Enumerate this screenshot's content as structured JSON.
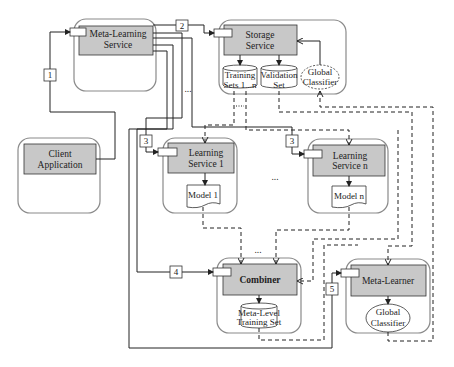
{
  "diagram": {
    "title": "",
    "nodes": {
      "meta_learning_service": {
        "label_1": "Meta-Learning",
        "label_2": "Service"
      },
      "storage_service": {
        "label_1": "Storage",
        "label_2": "Service"
      },
      "training_sets": {
        "label_1": "Training",
        "label_2": "Sets 1...n"
      },
      "validation_set": {
        "label_1": "Validation",
        "label_2": "Set"
      },
      "global_classifier_storage": {
        "label_1": "Global",
        "label_2": "Classifier"
      },
      "client_application": {
        "label_1": "Client",
        "label_2": "Application"
      },
      "learning_service_1": {
        "label_1": "Learning",
        "label_2": "Service 1"
      },
      "model_1": {
        "label": "Model 1"
      },
      "learning_service_n": {
        "label_1": "Learning",
        "label_2": "Service n"
      },
      "model_n": {
        "label": "Model n"
      },
      "combiner": {
        "label": "Combiner"
      },
      "meta_level_training_set": {
        "label_1": "Meta-Level",
        "label_2": "Training Set"
      },
      "meta_learner": {
        "label": "Meta-Learner"
      },
      "global_classifier_meta": {
        "label_1": "Global",
        "label_2": "Classifier"
      }
    },
    "steps": [
      "1",
      "2",
      "3",
      "3",
      "4",
      "5"
    ],
    "ellipsis": "...",
    "colors": {
      "service_fill": "#c8c8c8",
      "container_stroke": "#8a8a8a",
      "line": "#222222"
    }
  }
}
